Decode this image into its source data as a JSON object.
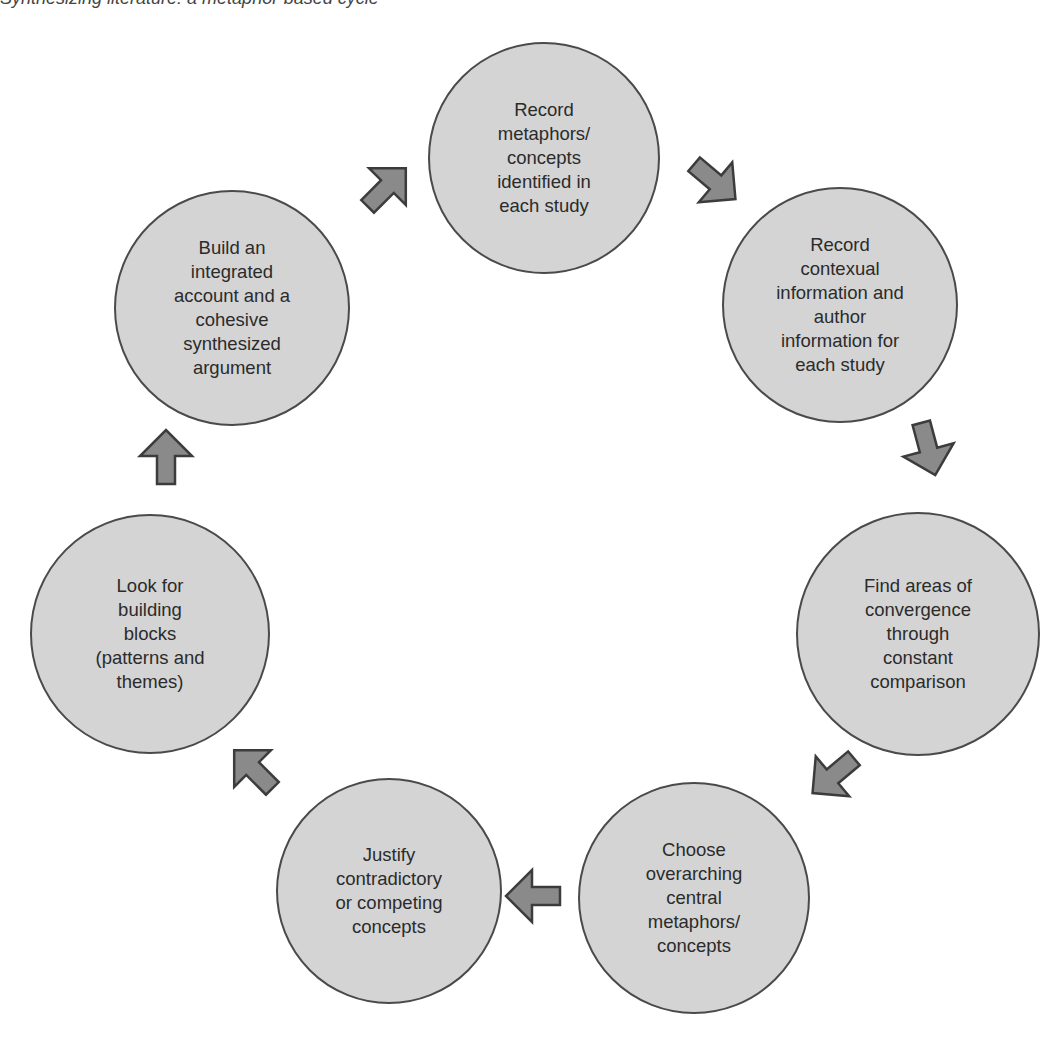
{
  "header": {
    "clipped_text": "Synthesizing literature: a metaphor-based cycle"
  },
  "colors": {
    "node_fill": "#d4d4d4",
    "node_border": "#4a4a4a",
    "arrow_fill": "#8a8a8a",
    "text": "#2b2b2b"
  },
  "diagram": {
    "type": "cycle",
    "nodes": [
      {
        "id": "n1",
        "label": "Record\nmetaphors/\nconcepts\nidentified in\neach study"
      },
      {
        "id": "n2",
        "label": "Record\ncontexual\ninformation and\nauthor\ninformation for\neach study"
      },
      {
        "id": "n3",
        "label": "Find areas of\nconvergence\nthrough\nconstant\ncomparison"
      },
      {
        "id": "n4",
        "label": "Choose\noverarching\ncentral\nmetaphors/\nconcepts"
      },
      {
        "id": "n5",
        "label": "Justify\ncontradictory\nor competing\nconcepts"
      },
      {
        "id": "n6",
        "label": "Look for\nbuilding\nblocks\n(patterns and\nthemes)"
      },
      {
        "id": "n7",
        "label": "Build an\nintegrated\naccount and a\ncohesive\nsynthesized\nargument"
      }
    ],
    "edges": [
      {
        "from": "n1",
        "to": "n2",
        "icon": "arrow-down-right-icon"
      },
      {
        "from": "n2",
        "to": "n3",
        "icon": "arrow-down-icon"
      },
      {
        "from": "n3",
        "to": "n4",
        "icon": "arrow-down-left-icon"
      },
      {
        "from": "n4",
        "to": "n5",
        "icon": "arrow-left-icon"
      },
      {
        "from": "n5",
        "to": "n6",
        "icon": "arrow-up-left-icon"
      },
      {
        "from": "n6",
        "to": "n7",
        "icon": "arrow-up-icon"
      },
      {
        "from": "n7",
        "to": "n1",
        "icon": "arrow-up-right-icon"
      }
    ]
  }
}
